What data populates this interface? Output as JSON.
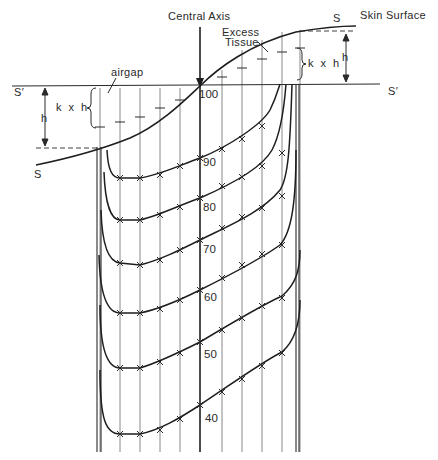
{
  "diagram": {
    "type": "isodose-distribution",
    "labels": {
      "central_axis": "Central Axis",
      "skin_surface": "Skin Surface",
      "s_right": "S",
      "s_left": "S",
      "s_prime_left": "S′",
      "s_prime_right": "S′",
      "excess_tissue_line1": "Excess",
      "excess_tissue_line2": "Tissue",
      "airgap": "airgap",
      "k_x_h_left": "k x h",
      "k_x_h_right": "k x h",
      "h_left": "h",
      "h_right": "h"
    },
    "isodose_values": [
      "100",
      "90",
      "80",
      "70",
      "60",
      "50",
      "40"
    ],
    "colors": {
      "line": "#2a2a2a",
      "thin_line": "#6a6a6a",
      "background": "#ffffff"
    }
  }
}
